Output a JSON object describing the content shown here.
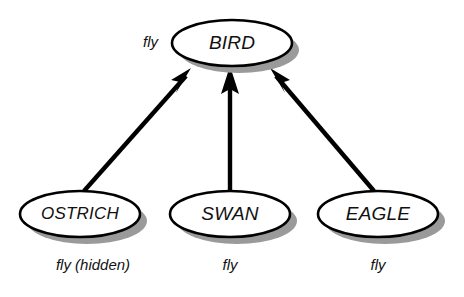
{
  "diagram": {
    "background_color": "#ffffff",
    "ink_color": "#000000",
    "shadow_color": "#9a9a9a",
    "nodes": [
      {
        "id": "bird",
        "label": "BIRD",
        "cx": 232,
        "cy": 43,
        "rx": 60,
        "ry": 23,
        "property_label": "fly",
        "property_x": 158,
        "property_y": 43,
        "property_anchor": "end"
      },
      {
        "id": "ostrich",
        "label": "OSTRICH",
        "cx": 80,
        "cy": 214,
        "rx": 60,
        "ry": 23,
        "property_label": "fly (hidden)",
        "property_x": 93,
        "property_y": 266,
        "property_anchor": "middle"
      },
      {
        "id": "swan",
        "label": "SWAN",
        "cx": 230,
        "cy": 214,
        "rx": 60,
        "ry": 23,
        "property_label": "fly",
        "property_x": 230,
        "property_y": 266,
        "property_anchor": "middle"
      },
      {
        "id": "eagle",
        "label": "EAGLE",
        "cx": 378,
        "cy": 214,
        "rx": 60,
        "ry": 23,
        "property_label": "fly",
        "property_x": 378,
        "property_y": 266,
        "property_anchor": "middle"
      }
    ],
    "edges": [
      {
        "id": "ostrich-to-bird",
        "from": "ostrich",
        "to": "bird",
        "x1": 84,
        "y1": 191,
        "x2": 190,
        "y2": 70,
        "arrowhead": "solid-triangle"
      },
      {
        "id": "swan-to-bird",
        "from": "swan",
        "to": "bird",
        "x1": 230,
        "y1": 191,
        "x2": 230,
        "y2": 68,
        "arrowhead": "solid-triangle"
      },
      {
        "id": "eagle-to-bird",
        "from": "eagle",
        "to": "bird",
        "x1": 374,
        "y1": 191,
        "x2": 272,
        "y2": 70,
        "arrowhead": "solid-triangle"
      }
    ]
  }
}
